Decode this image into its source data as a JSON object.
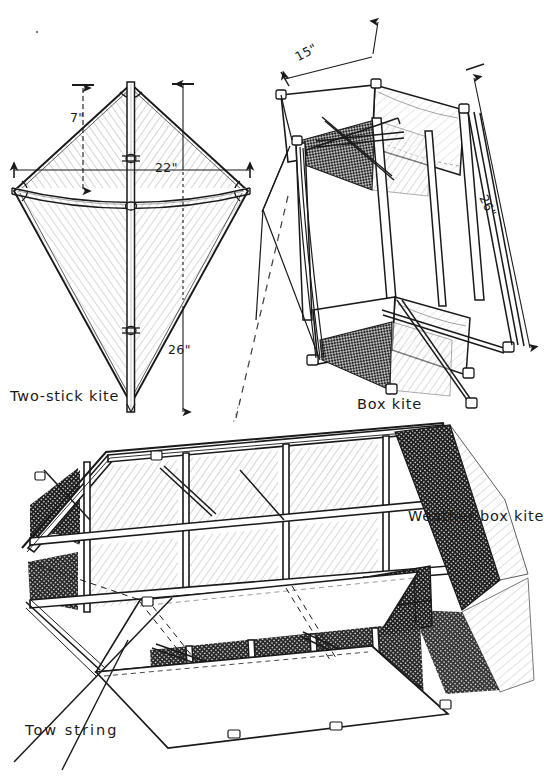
{
  "figure": {
    "title_visible": false,
    "background_color": "#ffffff",
    "ink_color": "#1a1a1a",
    "medium": "pen-and-ink technical line drawing"
  },
  "diagrams": [
    {
      "id": "two-stick-kite",
      "caption": "Two-stick kite",
      "caption_position": {
        "x": 10,
        "y": 388
      },
      "description": "Diamond kite with vertical spine and bowed horizontal cross spar, hatched sail surfaces",
      "dimensions": [
        {
          "label": "7\"",
          "meaning": "spine top to cross spar",
          "x": 70,
          "y": 110,
          "orientation": "vertical"
        },
        {
          "label": "22\"",
          "meaning": "cross spar width",
          "x": 155,
          "y": 160,
          "orientation": "horizontal"
        },
        {
          "label": "26\"",
          "meaning": "overall spine height",
          "x": 168,
          "y": 342,
          "orientation": "vertical"
        }
      ]
    },
    {
      "id": "box-kite",
      "caption": "Box kite",
      "caption_position": {
        "x": 357,
        "y": 396
      },
      "description": "Tilted rectangular box kite with two sail bands, diagonal cross bracing and bridle lines",
      "dimensions": [
        {
          "label": "15\"",
          "meaning": "box width across top",
          "x": 296,
          "y": 50,
          "orientation": "diagonal"
        },
        {
          "label": "26\"",
          "meaning": "box length",
          "x": 483,
          "y": 188,
          "orientation": "diagonal"
        }
      ]
    },
    {
      "id": "weather-box-kite",
      "caption": "Weather box kite",
      "caption_position": {
        "x": 408,
        "y": 508
      },
      "description": "Large cellular weather box kite drawn in perspective with a four by two grid of framed cells, dark mesh panels and pale sail panels",
      "grid": {
        "columns": 4,
        "rows": 2
      },
      "dimensions": [],
      "annotations": [
        {
          "label": "Tow string",
          "x": 25,
          "y": 722,
          "leader": "diagonal line crossing between the two words"
        }
      ]
    }
  ],
  "labels": {
    "two_stick_kite": "Two-stick kite",
    "box_kite": "Box kite",
    "weather_box_kite": "Weather box kite",
    "tow_string": "Tow string",
    "dim_7": "7\"",
    "dim_22": "22\"",
    "dim_26_kite": "26\"",
    "dim_15_box": "15\"",
    "dim_26_box": "26\""
  }
}
